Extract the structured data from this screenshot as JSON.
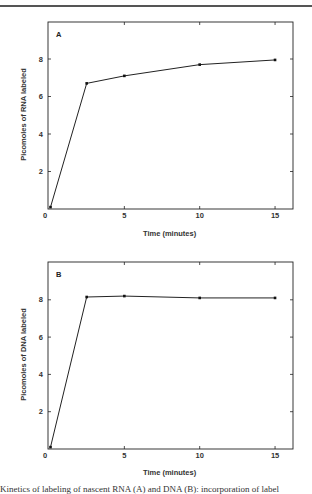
{
  "chart_data": [
    {
      "type": "line",
      "panel_label": "A",
      "title": "",
      "xlabel": "Time (minutes)",
      "ylabel": "Picomoles of RNA labeled",
      "x_ticks": [
        0,
        5,
        10,
        15
      ],
      "y_ticks": [
        0,
        2,
        4,
        6,
        8
      ],
      "xlim": [
        0,
        16.2
      ],
      "ylim": [
        0,
        10
      ],
      "grid": false,
      "legend": null,
      "series": [
        {
          "name": "RNA",
          "x": [
            0.1,
            2.5,
            5,
            10,
            15
          ],
          "values": [
            0.1,
            6.7,
            7.1,
            7.7,
            7.95
          ]
        }
      ]
    },
    {
      "type": "line",
      "panel_label": "B",
      "title": "",
      "xlabel": "Time (minutes)",
      "ylabel": "Picomoles of DNA labeled",
      "x_ticks": [
        0,
        5,
        10,
        15
      ],
      "y_ticks": [
        0,
        2,
        4,
        6,
        8
      ],
      "xlim": [
        0,
        16.2
      ],
      "ylim": [
        0,
        10
      ],
      "grid": false,
      "legend": null,
      "series": [
        {
          "name": "DNA",
          "x": [
            0.1,
            2.5,
            5,
            10,
            15
          ],
          "values": [
            0.1,
            8.15,
            8.2,
            8.1,
            8.1
          ]
        }
      ]
    }
  ],
  "panels": {
    "a": {
      "label": "A",
      "ylabel": "Picomoles of RNA labeled",
      "xlabel": "Time (minutes)"
    },
    "b": {
      "label": "B",
      "ylabel": "Picomoles of DNA labeled",
      "xlabel": "Time (minutes)"
    }
  },
  "caption": "Kinetics of labeling of nascent RNA (A) and DNA (B): incorporation of label"
}
